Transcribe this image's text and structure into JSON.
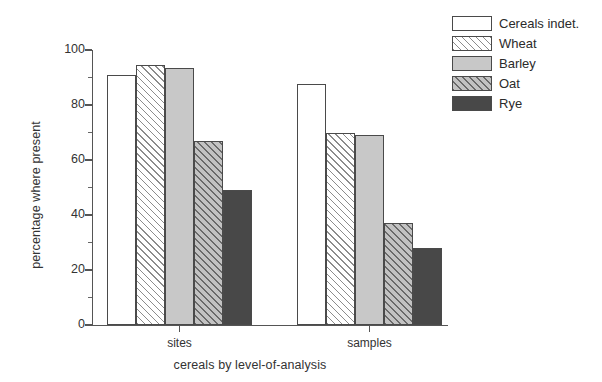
{
  "chart_data": {
    "type": "bar",
    "title": "",
    "xlabel": "cereals by level-of-analysis",
    "ylabel": "percentage where present",
    "categories": [
      "sites",
      "samples"
    ],
    "series": [
      {
        "name": "Cereals indet.",
        "values": [
          91,
          87.5
        ],
        "fill": "white",
        "color": "#ffffff"
      },
      {
        "name": "Wheat",
        "values": [
          94.5,
          70
        ],
        "fill": "hatch-light",
        "color": "#ffffff"
      },
      {
        "name": "Barley",
        "values": [
          93.5,
          69
        ],
        "fill": "gray",
        "color": "#c8c8c8"
      },
      {
        "name": "Oat",
        "values": [
          67,
          37
        ],
        "fill": "hatch-gray",
        "color": "#9a9a9a"
      },
      {
        "name": "Rye",
        "values": [
          49,
          28
        ],
        "fill": "dark",
        "color": "#484848"
      }
    ],
    "ylim": [
      0,
      100
    ],
    "y_ticks": [
      0,
      20,
      40,
      60,
      80,
      100
    ],
    "y_minor_ticks": [
      10,
      30,
      50,
      70,
      90
    ],
    "y_tick_labels": [
      "0",
      "20",
      "40",
      "60",
      "80",
      "100"
    ],
    "grid": false,
    "legend_position": "top-right",
    "legend_entries": [
      "Cereals indet.",
      "Wheat",
      "Barley",
      "Oat",
      "Rye"
    ]
  }
}
